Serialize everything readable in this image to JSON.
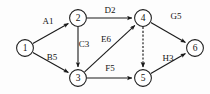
{
  "diagram": {
    "type": "directed-graph",
    "canvas": {
      "width": 210,
      "height": 94
    },
    "node_radius": 8.4,
    "colors": {
      "background": "#fdfdfd",
      "stroke": "#1a1a1a",
      "node_fill": "#ffffff",
      "text": "#141414"
    },
    "nodes": [
      {
        "id": "1",
        "label": "1",
        "x": 25,
        "y": 48
      },
      {
        "id": "2",
        "label": "2",
        "x": 78,
        "y": 18
      },
      {
        "id": "3",
        "label": "3",
        "x": 78,
        "y": 78
      },
      {
        "id": "4",
        "label": "4",
        "x": 143,
        "y": 18
      },
      {
        "id": "5",
        "label": "5",
        "x": 143,
        "y": 78
      },
      {
        "id": "6",
        "label": "6",
        "x": 195,
        "y": 48
      }
    ],
    "edges": [
      {
        "id": "A",
        "label": "A1",
        "from": "1",
        "to": "2",
        "style": "solid",
        "label_x": 48,
        "label_y": 21
      },
      {
        "id": "B",
        "label": "B5",
        "from": "1",
        "to": "3",
        "style": "solid",
        "label_x": 52,
        "label_y": 57
      },
      {
        "id": "D",
        "label": "D2",
        "from": "2",
        "to": "4",
        "style": "solid",
        "label_x": 110,
        "label_y": 10
      },
      {
        "id": "C",
        "label": "C3",
        "from": "2",
        "to": "3",
        "style": "solid",
        "label_x": 84,
        "label_y": 44
      },
      {
        "id": "E",
        "label": "E6",
        "from": "3",
        "to": "4",
        "style": "solid",
        "label_x": 106,
        "label_y": 39
      },
      {
        "id": "F",
        "label": "F5",
        "from": "3",
        "to": "5",
        "style": "solid",
        "label_x": 110,
        "label_y": 68
      },
      {
        "id": "dummy",
        "label": "",
        "from": "4",
        "to": "5",
        "style": "dashed",
        "label_x": 0,
        "label_y": 0
      },
      {
        "id": "G",
        "label": "G5",
        "from": "4",
        "to": "6",
        "style": "solid",
        "label_x": 176,
        "label_y": 16
      },
      {
        "id": "H",
        "label": "H3",
        "from": "5",
        "to": "6",
        "style": "solid",
        "label_x": 168,
        "label_y": 58
      }
    ]
  }
}
